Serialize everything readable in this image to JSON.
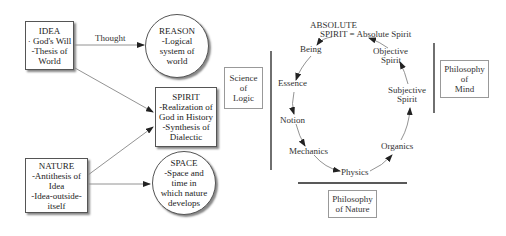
{
  "left_diagram": {
    "idea": {
      "title": "IDEA",
      "lines": [
        "· God's Will",
        "-Thesis of",
        "World"
      ]
    },
    "reason": {
      "title": "REASON",
      "lines": [
        "-Logical",
        "system of",
        "world"
      ]
    },
    "spirit": {
      "title": "SPIRIT",
      "lines": [
        "-Realization of",
        "God in History",
        "-Synthesis of",
        "Dialectic"
      ]
    },
    "nature": {
      "title": "NATURE",
      "lines": [
        "-Antithesis of",
        "Idea",
        "-Idea-outside-",
        "itself"
      ]
    },
    "space": {
      "title": "SPACE",
      "lines": [
        "-Space and",
        "time in",
        "which nature",
        "develops"
      ]
    },
    "edges": [
      {
        "from": "idea",
        "to": "reason",
        "label": "Thought"
      },
      {
        "from": "idea",
        "to": "spirit",
        "label": ""
      },
      {
        "from": "nature",
        "to": "spirit",
        "label": ""
      },
      {
        "from": "nature",
        "to": "space",
        "label": ""
      }
    ]
  },
  "cycle_diagram": {
    "top_label_line1": "ABSOLUTE",
    "top_label_line2": "SPIRIT = Absolute Spirit",
    "nodes": {
      "being": "Being",
      "essence": "Essence",
      "notion": "Notion",
      "mechanics": "Mechanics",
      "physics": "Physics",
      "organics": "Organics",
      "subjective_spirit_1": "Subjective",
      "subjective_spirit_2": "Spirit",
      "objective_spirit_1": "Objective",
      "objective_spirit_2": "Spirit"
    },
    "sequence": [
      "Absolute Spirit",
      "Being",
      "Essence",
      "Notion",
      "Mechanics",
      "Physics",
      "Organics",
      "Subjective Spirit",
      "Objective Spirit",
      "Absolute Spirit"
    ],
    "groups": {
      "logic": {
        "line1": "Science",
        "line2": "of",
        "line3": "Logic"
      },
      "mind": {
        "line1": "Philosophy",
        "line2": "of",
        "line3": "Mind"
      },
      "nature": {
        "line1": "Philosophy",
        "line2": "of Nature"
      }
    }
  }
}
